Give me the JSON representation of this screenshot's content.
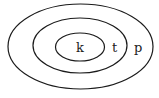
{
  "diagram": {
    "type": "nested-sets",
    "stroke_color": "#1a1a1a",
    "sets": [
      {
        "label": "p",
        "cx": 80.5,
        "cy": 46.5,
        "rx": 72.5,
        "ry": 42.5
      },
      {
        "label": "t",
        "cx": 80,
        "cy": 45.5,
        "rx": 47,
        "ry": 27.5
      },
      {
        "label": "k",
        "cx": 80,
        "cy": 47,
        "rx": 24.5,
        "ry": 14
      }
    ],
    "labels": {
      "k": "k",
      "t": "t",
      "p": "p"
    }
  }
}
